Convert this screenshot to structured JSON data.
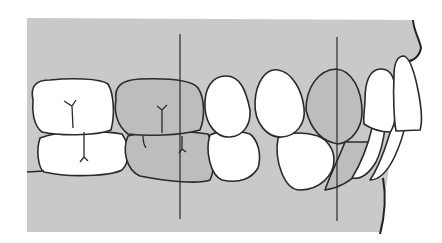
{
  "figure": {
    "colors": {
      "background_tissue": "#c9c9c9",
      "highlighted_teeth": "#bdbdbd",
      "unhighlighted_teeth": "#ffffff",
      "outline": "#2a2a2a"
    },
    "reference_lines": [
      {
        "name": "molar-reference-line",
        "x": 180
      },
      {
        "name": "canine-reference-line",
        "x": 337
      }
    ],
    "highlighted_teeth": [
      "upper-first-molar",
      "lower-first-molar",
      "upper-canine",
      "lower-canine"
    ]
  }
}
